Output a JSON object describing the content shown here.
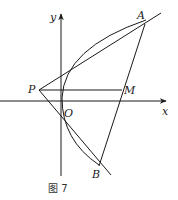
{
  "figure": {
    "caption": "图 7",
    "axes": {
      "x_label": "x",
      "y_label": "y",
      "origin_label": "O"
    },
    "points": {
      "P": "P",
      "M": "M",
      "A": "A",
      "B": "B"
    },
    "elements": [
      "parabola opening right with vertex at origin",
      "tangent line PA",
      "tangent line PB",
      "segment PM parallel to x-axis",
      "chord AB through M"
    ],
    "colors": {
      "stroke": "#1a1a1a",
      "background": "#ffffff"
    }
  }
}
